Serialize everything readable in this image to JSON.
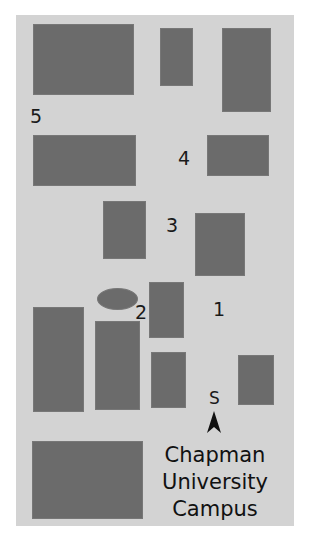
{
  "map": {
    "title_lines": [
      "Chapman",
      "University",
      "Campus"
    ],
    "background_color": "#d3d3d3",
    "building_color": "#6b6b6b",
    "compass": {
      "label": "S",
      "icon": "arrow-up-icon"
    },
    "labels": [
      {
        "id": "5",
        "text": "5"
      },
      {
        "id": "4",
        "text": "4"
      },
      {
        "id": "3",
        "text": "3"
      },
      {
        "id": "2",
        "text": "2"
      },
      {
        "id": "1",
        "text": "1"
      }
    ]
  }
}
